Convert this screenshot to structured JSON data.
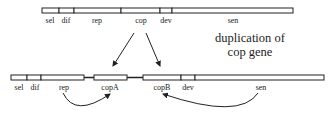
{
  "top_genome": {
    "segments": [
      "sel",
      "dif",
      "rep",
      "cop",
      "dev",
      "sen"
    ]
  },
  "bottom_genome": {
    "segments": [
      "sel",
      "dif",
      "rep",
      "copA",
      "copB",
      "dev",
      "sen"
    ]
  },
  "caption": {
    "line1": "duplication of",
    "line2": "cop gene"
  },
  "colors": {
    "stroke": "#222222",
    "fill": "#ffffff"
  }
}
